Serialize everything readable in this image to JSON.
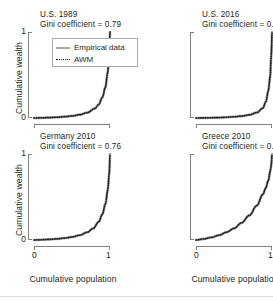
{
  "figure": {
    "shared_ylabel": "Cumulative wealth",
    "shared_xlabel": "Cumulative population",
    "ytick_low": "0",
    "ytick_high": "1",
    "xtick_low": "0",
    "xtick_high": "1"
  },
  "legend": {
    "items": [
      {
        "label": "Empirical data",
        "style": "solid",
        "color": "#a7a9ac"
      },
      {
        "label": "AWM",
        "style": "dotted",
        "color": "#231f20"
      }
    ]
  },
  "chart_data": {
    "type": "line",
    "xlabel": "Cumulative population",
    "ylabel": "Cumulative wealth",
    "xlim": [
      0,
      1
    ],
    "ylim": [
      0,
      1
    ],
    "grid": false,
    "legend_position": "inside-top-left-of-first-panel",
    "legend_entries": [
      "Empirical data",
      "AWM"
    ],
    "panels": [
      {
        "title": "U.S. 1989",
        "annotation": "Gini coefficient = 0.79",
        "gini": 0.79,
        "series": [
          {
            "name": "Empirical data",
            "x": [
              0,
              0.1,
              0.2,
              0.3,
              0.4,
              0.5,
              0.6,
              0.7,
              0.8,
              0.85,
              0.9,
              0.94,
              0.97,
              0.99,
              1
            ],
            "values": [
              0,
              0.002,
              0.005,
              0.009,
              0.015,
              0.024,
              0.038,
              0.062,
              0.11,
              0.155,
              0.24,
              0.36,
              0.53,
              0.73,
              1
            ]
          },
          {
            "name": "AWM",
            "x": [
              0,
              0.1,
              0.2,
              0.3,
              0.4,
              0.5,
              0.6,
              0.7,
              0.8,
              0.85,
              0.9,
              0.94,
              0.97,
              0.99,
              1
            ],
            "values": [
              0,
              0.002,
              0.005,
              0.009,
              0.015,
              0.024,
              0.038,
              0.062,
              0.11,
              0.155,
              0.24,
              0.36,
              0.53,
              0.73,
              1
            ]
          }
        ]
      },
      {
        "title": "U.S. 2016",
        "annotation": "Gini coefficient = 0.86",
        "gini": 0.86,
        "series": [
          {
            "name": "Empirical data",
            "x": [
              0,
              0.1,
              0.2,
              0.3,
              0.4,
              0.5,
              0.6,
              0.7,
              0.8,
              0.88,
              0.92,
              0.95,
              0.975,
              0.99,
              1
            ],
            "values": [
              0,
              0.001,
              0.003,
              0.005,
              0.009,
              0.014,
              0.022,
              0.036,
              0.063,
              0.115,
              0.19,
              0.31,
              0.47,
              0.71,
              1
            ]
          },
          {
            "name": "AWM",
            "x": [
              0,
              0.1,
              0.2,
              0.3,
              0.4,
              0.5,
              0.6,
              0.7,
              0.8,
              0.88,
              0.92,
              0.95,
              0.975,
              0.99,
              1
            ],
            "values": [
              0,
              0.001,
              0.003,
              0.005,
              0.009,
              0.014,
              0.022,
              0.036,
              0.063,
              0.115,
              0.19,
              0.31,
              0.47,
              0.71,
              1
            ]
          }
        ]
      },
      {
        "title": "Germany 2010",
        "annotation": "Gini coefficient = 0.76",
        "gini": 0.76,
        "series": [
          {
            "name": "Empirical data",
            "x": [
              0,
              0.1,
              0.2,
              0.3,
              0.4,
              0.5,
              0.6,
              0.7,
              0.78,
              0.85,
              0.9,
              0.94,
              0.97,
              0.99,
              1
            ],
            "values": [
              0,
              0.003,
              0.007,
              0.013,
              0.022,
              0.035,
              0.055,
              0.09,
              0.135,
              0.21,
              0.3,
              0.42,
              0.58,
              0.76,
              1
            ]
          },
          {
            "name": "AWM",
            "x": [
              0,
              0.1,
              0.2,
              0.3,
              0.4,
              0.5,
              0.6,
              0.7,
              0.78,
              0.85,
              0.9,
              0.94,
              0.97,
              0.99,
              1
            ],
            "values": [
              0,
              0.003,
              0.007,
              0.013,
              0.022,
              0.035,
              0.055,
              0.09,
              0.135,
              0.21,
              0.3,
              0.42,
              0.58,
              0.76,
              1
            ]
          }
        ]
      },
      {
        "title": "Greece 2010",
        "annotation": "Gini coefficient = 0.55",
        "gini": 0.55,
        "series": [
          {
            "name": "Empirical data",
            "x": [
              0,
              0.1,
              0.2,
              0.3,
              0.4,
              0.5,
              0.6,
              0.7,
              0.8,
              0.88,
              0.92,
              0.95,
              0.98,
              0.99,
              1
            ],
            "values": [
              0,
              0.012,
              0.03,
              0.055,
              0.09,
              0.135,
              0.2,
              0.285,
              0.4,
              0.53,
              0.61,
              0.69,
              0.81,
              0.87,
              1
            ]
          },
          {
            "name": "AWM",
            "x": [
              0,
              0.1,
              0.2,
              0.3,
              0.4,
              0.5,
              0.6,
              0.7,
              0.8,
              0.88,
              0.92,
              0.95,
              0.98,
              0.99,
              1
            ],
            "values": [
              0,
              0.012,
              0.03,
              0.055,
              0.09,
              0.135,
              0.2,
              0.285,
              0.4,
              0.53,
              0.61,
              0.69,
              0.81,
              0.87,
              1
            ]
          }
        ]
      }
    ]
  }
}
